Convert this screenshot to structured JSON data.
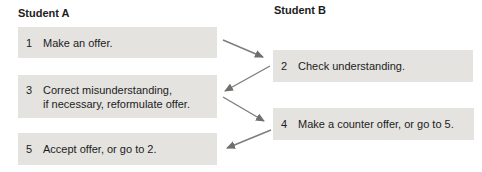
{
  "diagram": {
    "title_left": "Student A",
    "title_right": "Student B",
    "steps": [
      {
        "number": "1",
        "column": "A",
        "lines": [
          "Make an offer."
        ]
      },
      {
        "number": "2",
        "column": "B",
        "lines": [
          "Check understanding."
        ]
      },
      {
        "number": "3",
        "column": "A",
        "lines": [
          "Correct misunderstanding,",
          "if necessary, reformulate offer."
        ]
      },
      {
        "number": "4",
        "column": "B",
        "lines": [
          "Make a counter offer, or go to 5."
        ]
      },
      {
        "number": "5",
        "column": "A",
        "lines": [
          "Accept offer, or go to 2."
        ]
      }
    ],
    "arrows": [
      {
        "from": "1",
        "to": "2"
      },
      {
        "from": "2",
        "to": "3"
      },
      {
        "from": "3",
        "to": "4"
      },
      {
        "from": "4",
        "to": "5"
      }
    ],
    "colors": {
      "box_bg": "#e4e3e0",
      "arrow": "#7d7d7a",
      "text": "#1c1c1c"
    }
  }
}
